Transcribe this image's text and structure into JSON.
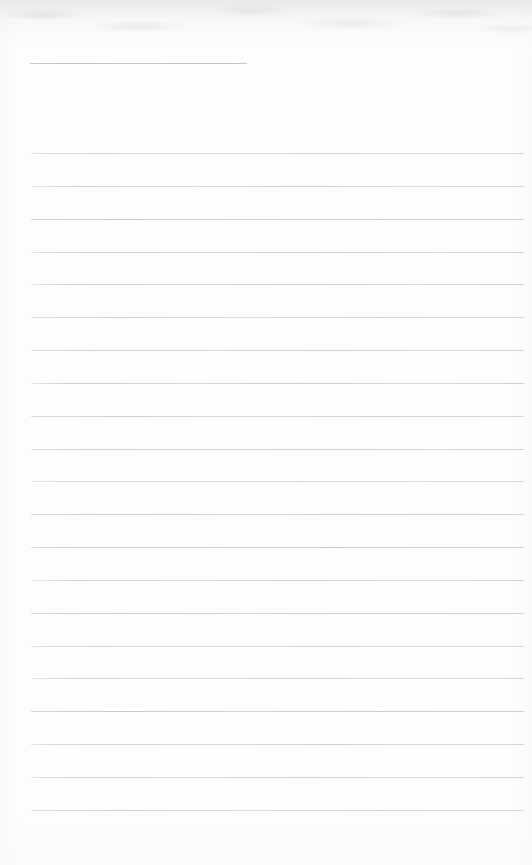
{
  "document": {
    "kind": "scanned-ruled-notepad-page",
    "title_text": "",
    "body_text": "",
    "page_width": 532,
    "page_height": 865,
    "background_color": "#fdfdfd",
    "rule_color": "#ccced2",
    "is_blank": "true",
    "notes_written": "",
    "total_rules": 22
  },
  "title_rule": {
    "label": "",
    "x_start": 30,
    "x_end": 247,
    "y": 63,
    "width": 217,
    "thickness": 1,
    "color": "#c4c6cb"
  },
  "body_rules": {
    "x_start": 31,
    "x_end": 524,
    "width": 493,
    "first_y": 153,
    "spacing": 32.85,
    "count": 21,
    "thickness": 1,
    "color": "#ccced2",
    "y_positions": [
      153,
      186,
      219,
      252,
      284,
      317,
      350,
      383,
      416,
      449,
      481,
      514,
      547,
      580,
      613,
      646,
      678,
      711,
      744,
      777,
      810
    ]
  },
  "margins": {
    "left": 31,
    "right": 8,
    "top": 63,
    "bottom": 55
  }
}
